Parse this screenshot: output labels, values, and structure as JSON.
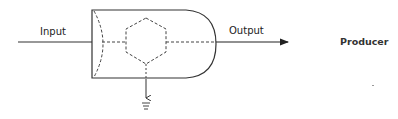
{
  "diagram": {
    "labels": {
      "input": "Input",
      "output": "Output",
      "title": "Producer"
    },
    "components": [
      {
        "id": "input-line",
        "type": "line",
        "label": "Input"
      },
      {
        "id": "producer-body",
        "type": "bullet-shaped enclosure"
      },
      {
        "id": "inner-hexagon",
        "type": "dashed hexagon"
      },
      {
        "id": "output-arrow",
        "type": "arrow",
        "label": "Output"
      },
      {
        "id": "ground-arrow",
        "type": "arrow to ground"
      }
    ],
    "colors": {
      "stroke": "#333333",
      "background": "#ffffff"
    }
  }
}
